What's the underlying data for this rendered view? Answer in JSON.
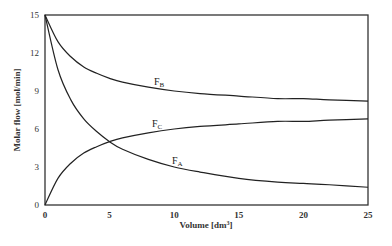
{
  "chart_data": {
    "type": "line",
    "title": "",
    "xlabel": "Volume [dm³]",
    "xlabel_main": "Volume [dm",
    "xlabel_sup": "3",
    "xlabel_end": "]",
    "ylabel": "Molar flow [mol/min]",
    "xlim": [
      0,
      25
    ],
    "ylim": [
      0,
      15
    ],
    "xticks": [
      0,
      5,
      10,
      15,
      20,
      25
    ],
    "yticks": [
      0,
      3,
      6,
      9,
      12,
      15
    ],
    "grid": false,
    "legend": "inline labels",
    "series": [
      {
        "name": "F_A",
        "label_main": "F",
        "label_sub": "A",
        "x": [
          0,
          1,
          2,
          3,
          4,
          5,
          6,
          8,
          10,
          12,
          15,
          18,
          20,
          22,
          25
        ],
        "values": [
          15,
          10.7,
          8.3,
          6.8,
          5.8,
          5.0,
          4.4,
          3.6,
          3.0,
          2.6,
          2.1,
          1.8,
          1.7,
          1.6,
          1.4
        ]
      },
      {
        "name": "F_B",
        "label_main": "F",
        "label_sub": "B",
        "x": [
          0,
          1,
          2,
          3,
          4,
          5,
          6,
          8,
          10,
          12,
          15,
          18,
          20,
          22,
          25
        ],
        "values": [
          15,
          12.9,
          11.7,
          10.9,
          10.4,
          10.0,
          9.7,
          9.3,
          9.0,
          8.8,
          8.6,
          8.4,
          8.4,
          8.3,
          8.2
        ]
      },
      {
        "name": "F_C",
        "label_main": "F",
        "label_sub": "C",
        "x": [
          0,
          1,
          2,
          3,
          4,
          5,
          6,
          8,
          10,
          12,
          15,
          18,
          20,
          22,
          25
        ],
        "values": [
          0,
          2.1,
          3.3,
          4.1,
          4.6,
          5.0,
          5.3,
          5.7,
          6.0,
          6.2,
          6.4,
          6.6,
          6.6,
          6.7,
          6.8
        ]
      }
    ]
  }
}
